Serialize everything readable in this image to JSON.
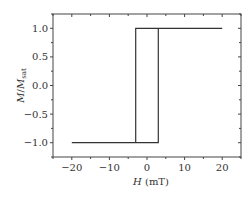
{
  "chart_data": {
    "type": "line",
    "title": "",
    "xlabel": "H (mT)",
    "xlabel_italic": "H",
    "xlabel_unit": " (mT)",
    "ylabel": "M/M_sat",
    "ylabel_parts": {
      "m1": "M",
      "slash": "/",
      "m2": "M",
      "sub": "sat"
    },
    "xlim": [
      -25,
      25
    ],
    "ylim": [
      -1.25,
      1.25
    ],
    "xticks": [
      -20,
      -10,
      0,
      10,
      20
    ],
    "xtick_labels": [
      "−20",
      "−10",
      "0",
      "10",
      "20"
    ],
    "yticks": [
      -1.0,
      -0.5,
      0.0,
      0.5,
      1.0
    ],
    "ytick_labels": [
      "−1.0",
      "−0.5",
      "0.0",
      "0.5",
      "1.0"
    ],
    "grid": false,
    "series": [
      {
        "name": "hysteresis-loop",
        "color": "#333333",
        "x": [
          -20,
          3,
          3,
          20,
          -3,
          -3,
          -20
        ],
        "y": [
          -1,
          -1,
          1,
          1,
          1,
          -1,
          -1
        ]
      }
    ]
  }
}
